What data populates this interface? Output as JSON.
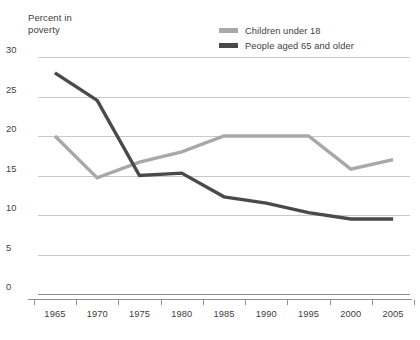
{
  "title": "Percent in\npoverty",
  "legend": {
    "position": "top-right",
    "items": [
      {
        "label": "Children under 18",
        "color": "#a8a8a8",
        "icon": "line-swatch-icon"
      },
      {
        "label": "People aged 65 and older",
        "color": "#4a4a4a",
        "icon": "line-swatch-icon"
      }
    ]
  },
  "yaxis": {
    "ticks": [
      "0",
      "5",
      "10",
      "15",
      "20",
      "25",
      "30"
    ],
    "min": 0,
    "max": 30,
    "step": 5
  },
  "xaxis": {
    "ticks": [
      "1965",
      "1970",
      "1975",
      "1980",
      "1985",
      "1990",
      "1995",
      "2000",
      "2005"
    ]
  },
  "chart_data": {
    "type": "line",
    "title": "Percent in poverty",
    "xlabel": "",
    "ylabel": "Percent in poverty",
    "x": [
      1965,
      1970,
      1975,
      1980,
      1985,
      1990,
      1995,
      2000,
      2005
    ],
    "xlim": [
      1963,
      2007
    ],
    "ylim": [
      0,
      30
    ],
    "ytick_step": 5,
    "grid": "horizontal",
    "legend_position": "top-right",
    "series": [
      {
        "name": "Children under 18",
        "color": "#a8a8a8",
        "values": [
          20.0,
          14.7,
          16.7,
          18.0,
          20.0,
          20.0,
          20.0,
          15.8,
          17.0
        ]
      },
      {
        "name": "People aged 65 and older",
        "color": "#4a4a4a",
        "values": [
          28.0,
          24.5,
          15.0,
          15.3,
          12.3,
          11.5,
          10.3,
          9.5,
          9.5
        ]
      }
    ]
  }
}
